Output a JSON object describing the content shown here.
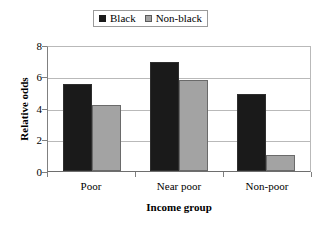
{
  "chart_data": {
    "type": "bar",
    "title": "",
    "xlabel": "Income group",
    "ylabel": "Relative odds",
    "categories": [
      "Poor",
      "Near poor",
      "Non-poor"
    ],
    "series": [
      {
        "name": "Black",
        "color": "#1a1a1a",
        "values": [
          5.5,
          6.9,
          4.9
        ]
      },
      {
        "name": "Non-black",
        "color": "#a3a3a3",
        "values": [
          4.2,
          5.8,
          1.0
        ]
      }
    ],
    "ylim": [
      0,
      8
    ],
    "yticks": [
      0,
      2,
      4,
      6,
      8
    ],
    "ytick_labels": [
      "0",
      "2",
      "4",
      "6",
      "8"
    ],
    "grid": "horizontal",
    "legend_position": "top-center",
    "legend_entries": [
      "Black",
      "Non-black"
    ]
  }
}
